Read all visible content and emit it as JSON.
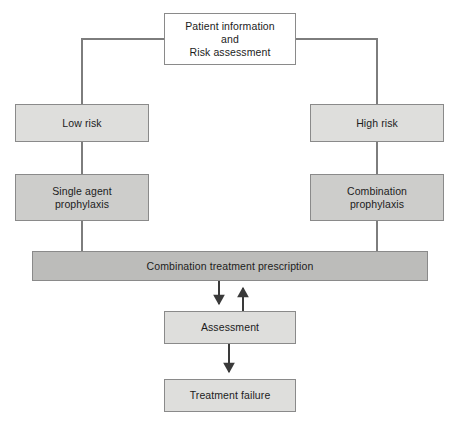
{
  "figure": {
    "type": "flowchart",
    "orientation": "top-down",
    "background_color": "#ffffff",
    "stroke_color": "#8a8a8a",
    "text_color": "#1c1c1c"
  },
  "nodes": {
    "patient": {
      "label": "Patient information\nand\nRisk assessment",
      "fill": "#ffffff"
    },
    "low_risk": {
      "label": "Low risk",
      "fill": "#dededc"
    },
    "high_risk": {
      "label": "High risk",
      "fill": "#dededc"
    },
    "single_agent": {
      "label": "Single agent\nprophylaxis",
      "fill": "#cdcdcb"
    },
    "combination": {
      "label": "Combination\nprophylaxis",
      "fill": "#cdcdcb"
    },
    "prescription": {
      "label": "Combination treatment prescription",
      "fill": "#bcbcba"
    },
    "assessment": {
      "label": "Assessment",
      "fill": "#dededc"
    },
    "treatment_failure": {
      "label": "Treatment failure",
      "fill": "#dededc"
    }
  },
  "edges": [
    {
      "from": "patient",
      "to": "low_risk",
      "style": "elbow",
      "arrowhead": "none"
    },
    {
      "from": "patient",
      "to": "high_risk",
      "style": "elbow",
      "arrowhead": "none"
    },
    {
      "from": "low_risk",
      "to": "single_agent",
      "style": "straight",
      "arrowhead": "none"
    },
    {
      "from": "high_risk",
      "to": "combination",
      "style": "straight",
      "arrowhead": "none"
    },
    {
      "from": "single_agent",
      "to": "prescription",
      "style": "straight",
      "arrowhead": "none"
    },
    {
      "from": "combination",
      "to": "prescription",
      "style": "straight",
      "arrowhead": "none"
    },
    {
      "from": "prescription",
      "to": "assessment",
      "style": "straight",
      "arrowhead": "down"
    },
    {
      "from": "assessment",
      "to": "prescription",
      "style": "straight",
      "arrowhead": "up"
    },
    {
      "from": "assessment",
      "to": "treatment_failure",
      "style": "straight",
      "arrowhead": "down"
    }
  ]
}
